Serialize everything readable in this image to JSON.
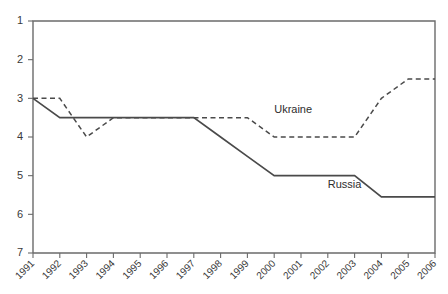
{
  "chart_data": {
    "type": "line",
    "title": "",
    "subtitle": "",
    "xlabel": "",
    "ylabel": "",
    "x": [
      1991,
      1992,
      1993,
      1994,
      1995,
      1996,
      1997,
      1998,
      1999,
      2000,
      2001,
      2002,
      2003,
      2004,
      2005,
      2006
    ],
    "categories": [
      "1991",
      "1992",
      "1993",
      "1994",
      "1995",
      "1996",
      "1997",
      "1998",
      "1999",
      "2000",
      "2001",
      "2002",
      "2003",
      "2004",
      "2005",
      "2006"
    ],
    "series": [
      {
        "name": "Ukraine",
        "style": "dashed",
        "color": "#4a4a4a",
        "values": [
          3.0,
          3.0,
          4.0,
          3.5,
          3.5,
          3.5,
          3.5,
          3.5,
          3.5,
          4.0,
          4.0,
          4.0,
          4.0,
          3.0,
          2.5,
          2.5
        ],
        "label_x": 2000,
        "label_y": 3.37
      },
      {
        "name": "Russia",
        "style": "solid",
        "color": "#4a4a4a",
        "values": [
          3.0,
          3.5,
          3.5,
          3.5,
          3.5,
          3.5,
          3.5,
          4.0,
          4.5,
          5.0,
          5.0,
          5.0,
          5.0,
          5.55,
          5.55,
          5.55
        ],
        "label_x": 2002,
        "label_y": 5.32
      }
    ],
    "yticks": [
      1,
      2,
      3,
      4,
      5,
      6,
      7
    ],
    "ytick_labels": [
      "1",
      "2",
      "3",
      "4",
      "5",
      "6",
      "7"
    ],
    "ylim": [
      1,
      7
    ],
    "y_inverted": true,
    "xlim": [
      1991,
      2006
    ],
    "grid": false,
    "legend_position": "inline-annotations",
    "axis_color": "#6b6b6b",
    "text_color": "#3a3a3a",
    "background": "#ffffff"
  },
  "plot_geometry": {
    "left": 33,
    "right": 435,
    "top": 21,
    "bottom": 253,
    "xtick_label_rotation": -45
  }
}
